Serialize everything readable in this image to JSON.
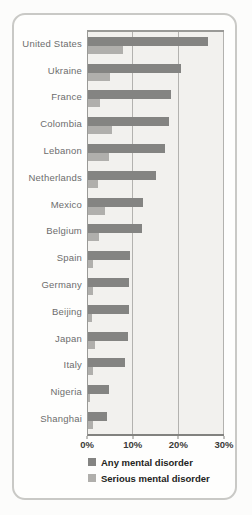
{
  "chart_data": {
    "type": "bar",
    "orientation": "horizontal",
    "title": "",
    "xlabel": "",
    "ylabel": "",
    "xlim": [
      0,
      30
    ],
    "x_tick_labels": [
      "0%",
      "10%",
      "20%",
      "30%"
    ],
    "grid": true,
    "legend_position": "bottom",
    "categories": [
      "United States",
      "Ukraine",
      "France",
      "Colombia",
      "Lebanon",
      "Netherlands",
      "Mexico",
      "Belgium",
      "Spain",
      "Germany",
      "Beijing",
      "Japan",
      "Italy",
      "Nigeria",
      "Shanghai"
    ],
    "series": [
      {
        "name": "Any mental disorder",
        "color": "#848482",
        "values": [
          26.4,
          20.5,
          18.4,
          17.8,
          16.9,
          14.9,
          12.2,
          12.0,
          9.2,
          9.1,
          9.1,
          8.8,
          8.2,
          4.7,
          4.3
        ]
      },
      {
        "name": "Serious mental disorder",
        "color": "#b0afac",
        "values": [
          7.7,
          4.8,
          2.7,
          5.2,
          4.6,
          2.3,
          3.7,
          2.4,
          1.0,
          1.2,
          0.9,
          1.5,
          1.0,
          0.4,
          1.1
        ]
      }
    ]
  },
  "colors": {
    "page_background": "#fcfcfb",
    "card_background": "#fefefd",
    "card_border": "#c9c9c6",
    "plot_background": "#f2f1ee",
    "plot_border": "#9a9a97",
    "gridline": "#b3b2af",
    "axis_line": "#82827f",
    "label_text": "#6d6d6d",
    "tick_text": "#3a3a38",
    "legend_text": "#232321"
  }
}
